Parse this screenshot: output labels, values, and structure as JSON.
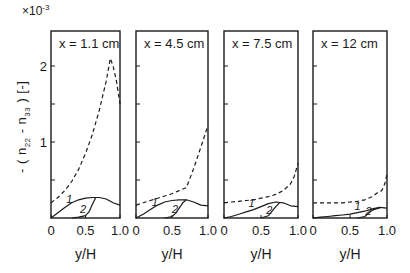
{
  "chart_data": {
    "type": "line",
    "title": "",
    "scale_factor": "×10^-3",
    "scale_base": "×10",
    "scale_exp": "-3",
    "ylabel": "- ( n22 - n33 )  [-]",
    "ylabel_parts": {
      "pre": "- ( n",
      "sub1": "22",
      "mid": " - n",
      "sub2": "33",
      "post": " )   [-]"
    },
    "xlabel": "y/H",
    "ylim": [
      0,
      2.45
    ],
    "xlim": [
      0,
      1.0
    ],
    "yticks": [
      0,
      0.5,
      1,
      1.5,
      2
    ],
    "ytick_labels": {
      "1": "1",
      "2": "2"
    },
    "xticks": [
      0,
      0.5,
      1.0
    ],
    "xtick_labels": [
      "0",
      "0.5",
      "1.0"
    ],
    "grid": false,
    "legend": "curves labelled inline: 1, 2; dashed curve unlabelled",
    "panels": [
      {
        "title": "x = 1.1 cm",
        "series": [
          {
            "name": "dashed",
            "style": "dashed",
            "x": [
              0,
              0.1,
              0.2,
              0.3,
              0.4,
              0.5,
              0.6,
              0.7,
              0.8,
              0.86,
              0.9,
              0.95,
              1.0
            ],
            "y": [
              0.2,
              0.27,
              0.36,
              0.48,
              0.64,
              0.85,
              1.1,
              1.42,
              1.8,
              2.1,
              2.0,
              1.8,
              1.5
            ]
          },
          {
            "name": "1",
            "style": "solid",
            "x": [
              0,
              0.1,
              0.2,
              0.3,
              0.4,
              0.5,
              0.6,
              0.7,
              0.8,
              0.9,
              1.0
            ],
            "y": [
              0.0,
              0.07,
              0.14,
              0.2,
              0.24,
              0.26,
              0.27,
              0.27,
              0.25,
              0.2,
              0.17
            ]
          },
          {
            "name": "2",
            "style": "solid",
            "x": [
              0.3,
              0.4,
              0.5,
              0.55,
              0.6,
              0.65
            ],
            "y": [
              0.0,
              0.01,
              0.03,
              0.08,
              0.18,
              0.27
            ]
          }
        ],
        "label_positions": {
          "1": [
            0.22,
            0.2
          ],
          "2": [
            0.42,
            0.07
          ]
        }
      },
      {
        "title": "x = 4.5 cm",
        "series": [
          {
            "name": "dashed",
            "style": "dashed",
            "x": [
              0,
              0.1,
              0.2,
              0.3,
              0.4,
              0.5,
              0.6,
              0.7,
              0.8,
              0.9,
              1.0
            ],
            "y": [
              0.17,
              0.2,
              0.23,
              0.26,
              0.29,
              0.32,
              0.36,
              0.4,
              0.65,
              0.93,
              1.22
            ]
          },
          {
            "name": "1",
            "style": "solid",
            "x": [
              0,
              0.1,
              0.2,
              0.3,
              0.4,
              0.5,
              0.6,
              0.7,
              0.8,
              0.9,
              1.0
            ],
            "y": [
              0.0,
              0.05,
              0.11,
              0.17,
              0.21,
              0.23,
              0.24,
              0.24,
              0.21,
              0.17,
              0.16
            ]
          },
          {
            "name": "2",
            "style": "solid",
            "x": [
              0.4,
              0.5,
              0.55,
              0.6,
              0.65,
              0.7
            ],
            "y": [
              0.0,
              0.02,
              0.06,
              0.13,
              0.2,
              0.24
            ]
          }
        ],
        "label_positions": {
          "1": [
            0.22,
            0.16
          ],
          "2": [
            0.5,
            0.07
          ]
        }
      },
      {
        "title": "x = 7.5 cm",
        "series": [
          {
            "name": "dashed",
            "style": "dashed",
            "x": [
              0,
              0.1,
              0.2,
              0.3,
              0.4,
              0.5,
              0.6,
              0.7,
              0.8,
              0.9,
              0.95,
              1.0
            ],
            "y": [
              0.2,
              0.21,
              0.22,
              0.23,
              0.24,
              0.26,
              0.28,
              0.31,
              0.36,
              0.45,
              0.55,
              0.72
            ]
          },
          {
            "name": "1",
            "style": "solid",
            "x": [
              0,
              0.1,
              0.2,
              0.3,
              0.4,
              0.5,
              0.6,
              0.7,
              0.8,
              0.9,
              1.0
            ],
            "y": [
              0.0,
              0.02,
              0.05,
              0.08,
              0.11,
              0.15,
              0.19,
              0.21,
              0.2,
              0.16,
              0.15
            ]
          },
          {
            "name": "2",
            "style": "solid",
            "x": [
              0.5,
              0.6,
              0.65,
              0.7,
              0.75
            ],
            "y": [
              0.0,
              0.03,
              0.09,
              0.15,
              0.2
            ]
          }
        ],
        "label_positions": {
          "1": [
            0.33,
            0.14
          ],
          "2": [
            0.57,
            0.05
          ]
        }
      },
      {
        "title": "x = 12 cm",
        "series": [
          {
            "name": "dashed",
            "style": "dashed",
            "x": [
              0,
              0.1,
              0.2,
              0.3,
              0.4,
              0.5,
              0.6,
              0.7,
              0.8,
              0.88,
              0.93,
              0.97,
              1.0
            ],
            "y": [
              0.2,
              0.2,
              0.2,
              0.2,
              0.2,
              0.21,
              0.22,
              0.24,
              0.28,
              0.34,
              0.36,
              0.45,
              0.58
            ]
          },
          {
            "name": "1",
            "style": "solid",
            "x": [
              0,
              0.1,
              0.2,
              0.3,
              0.4,
              0.5,
              0.6,
              0.7,
              0.8,
              0.9,
              1.0
            ],
            "y": [
              0.0,
              0.01,
              0.02,
              0.03,
              0.04,
              0.05,
              0.07,
              0.09,
              0.12,
              0.14,
              0.13
            ]
          },
          {
            "name": "2",
            "style": "solid",
            "x": [
              0.6,
              0.7,
              0.75,
              0.8,
              0.85,
              0.9
            ],
            "y": [
              0.0,
              0.02,
              0.06,
              0.1,
              0.12,
              0.13
            ]
          }
        ],
        "label_positions": {
          "1": [
            0.56,
            0.11
          ],
          "2": [
            0.71,
            0.04
          ]
        }
      }
    ]
  },
  "layout": {
    "panels_px": [
      {
        "left": 51,
        "right": 120
      },
      {
        "left": 136,
        "right": 208
      },
      {
        "left": 224,
        "right": 298
      },
      {
        "left": 313,
        "right": 387
      }
    ],
    "top": 31,
    "zero_y": 218,
    "unit_px": 76
  }
}
